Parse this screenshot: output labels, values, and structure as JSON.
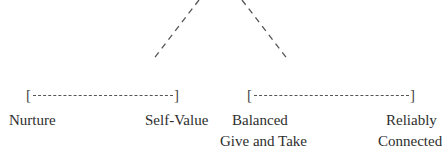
{
  "diagram": {
    "type": "tree-branch",
    "background": "#ffffff",
    "text_color": "#2e2e2e",
    "line_color": "#555555",
    "branches": [
      {
        "id": "left",
        "connector": {
          "from": [
            199,
            0
          ],
          "to": [
            152,
            61
          ],
          "style": "dashed"
        },
        "bracket": {
          "open": "[",
          "close": "]"
        },
        "endpoints": [
          {
            "label": "Nurture"
          },
          {
            "label": "Self-Value"
          }
        ]
      },
      {
        "id": "right",
        "connector": {
          "from": [
            242,
            0
          ],
          "to": [
            289,
            61
          ],
          "style": "dashed"
        },
        "bracket": {
          "open": "[",
          "close": "]"
        },
        "endpoints": [
          {
            "label_line1": "Balanced",
            "label_line2": "Give and Take"
          },
          {
            "label_line1": "Reliably",
            "label_line2": "Connected"
          }
        ]
      }
    ]
  }
}
